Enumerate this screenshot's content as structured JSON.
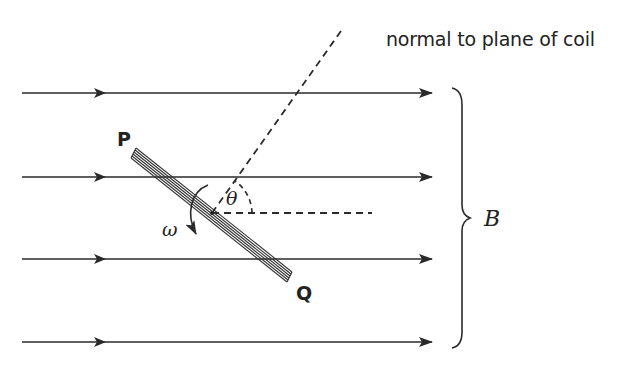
{
  "labels": {
    "normal": "normal to plane of coil",
    "end_p": "P",
    "end_q": "Q",
    "angle": "θ",
    "angular_velocity": "ω",
    "field": "B"
  },
  "field_lines_y": [
    93,
    177,
    259,
    342
  ],
  "colors": {
    "line": "#2a2a2a",
    "text": "#222222"
  }
}
